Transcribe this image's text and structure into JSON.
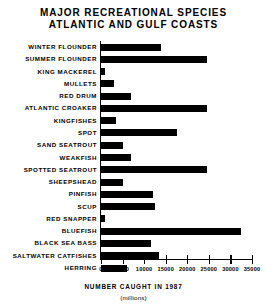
{
  "chart_data": {
    "type": "bar",
    "orientation": "horizontal",
    "title": "MAJOR RECREATIONAL SPECIES ATLANTIC AND GULF COASTS",
    "title_lines": [
      "MAJOR RECREATIONAL SPECIES",
      "ATLANTIC AND GULF COASTS"
    ],
    "xlabel": "NUMBER CAUGHT IN 1987",
    "xlabel_sub": "(millions)",
    "ylabel": "",
    "xlim": [
      0,
      35000
    ],
    "grid": false,
    "legend": false,
    "bar_color": "#000000",
    "xticks": [
      0,
      5000,
      10000,
      15000,
      20000,
      25000,
      30000,
      35000
    ],
    "xticklabels": [
      "0",
      "5000",
      "10000",
      "15000",
      "20000",
      "25000",
      "30000",
      "35000"
    ],
    "categories": [
      "WINTER FLOUNDER",
      "SUMMER FLOUNDER",
      "KING MACKEREL",
      "MULLETS",
      "RED DRUM",
      "ATLANTIC CROAKER",
      "KINGFISHES",
      "SPOT",
      "SAND SEATROUT",
      "WEAKFISH",
      "SPOTTED SEATROUT",
      "SHEEPSHEAD",
      "PINFISH",
      "SCUP",
      "RED SNAPPER",
      "BLUEFISH",
      "BLACK SEA BASS",
      "SALTWATER CATFISHES",
      "HERRING"
    ],
    "values": [
      14000,
      24500,
      1000,
      3000,
      7000,
      24500,
      3500,
      17500,
      5000,
      7000,
      24500,
      5000,
      12000,
      12500,
      1000,
      32500,
      11500,
      13500,
      6000
    ]
  }
}
